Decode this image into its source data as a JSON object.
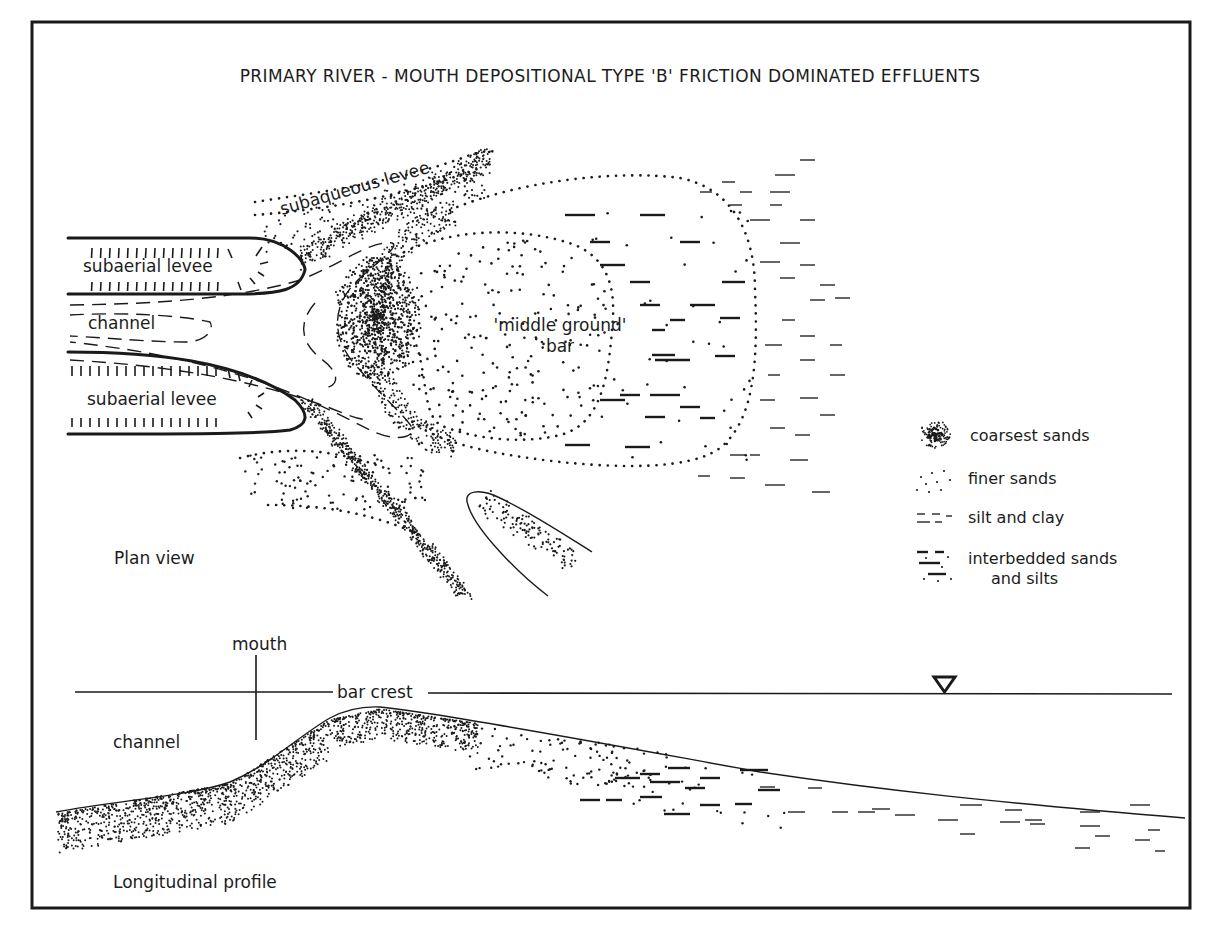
{
  "figure": {
    "title": "PRIMARY RIVER - MOUTH DEPOSITIONAL  TYPE 'B' FRICTION DOMINATED EFFLUENTS",
    "frame": {
      "x": 32,
      "y": 22,
      "width": 1158,
      "height": 886,
      "stroke": "#1a1a1a"
    },
    "ink_color": "#1a1a1a",
    "background": "#ffffff"
  },
  "plan_view": {
    "caption": "Plan view",
    "labels": {
      "subaqueous_levee": "subaqueous levee",
      "subaerial_levee_top": "subaerial levee",
      "subaerial_levee_bottom": "subaerial levee",
      "channel": "channel",
      "middle_ground_line1": "'middle ground'",
      "middle_ground_line2": "bar"
    }
  },
  "legend": {
    "items": [
      {
        "symbol": "coarsest-sands-symbol",
        "label": "coarsest sands"
      },
      {
        "symbol": "finer-sands-symbol",
        "label": "finer sands"
      },
      {
        "symbol": "silt-clay-symbol",
        "label": "silt and clay"
      },
      {
        "symbol": "interbedded-symbol",
        "label_line1": "interbedded sands",
        "label_line2": "and silts"
      }
    ]
  },
  "profile": {
    "caption": "Longitudinal profile",
    "labels": {
      "mouth": "mouth",
      "bar_crest": "bar crest",
      "channel": "channel"
    },
    "water_level_symbol": "water-level-triangle"
  }
}
